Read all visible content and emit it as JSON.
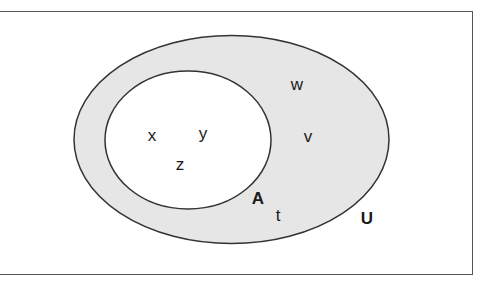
{
  "diagram": {
    "type": "venn",
    "universal_set": {
      "label": "U",
      "fill": "#e6e6e6",
      "stroke": "#333333",
      "elements_outside_A": [
        "w",
        "v",
        "t"
      ]
    },
    "set_A": {
      "label": "A",
      "fill": "#ffffff",
      "stroke": "#333333",
      "elements": [
        "x",
        "y",
        "z"
      ]
    },
    "labels": {
      "U": "U",
      "A": "A",
      "x": "x",
      "y": "y",
      "z": "z",
      "w": "w",
      "v": "v",
      "t": "t"
    }
  }
}
